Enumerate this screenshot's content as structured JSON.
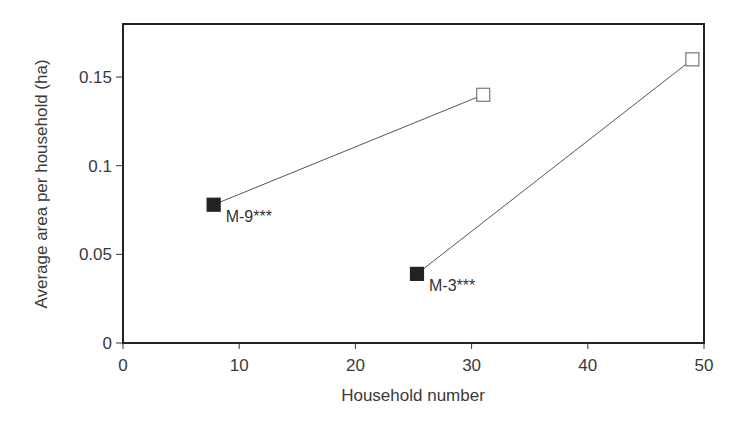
{
  "chart_data": {
    "type": "line",
    "title": "",
    "xlabel": "Household number",
    "ylabel": "Average area per household (ha)",
    "xlim": [
      0,
      50
    ],
    "ylim": [
      0,
      0.18
    ],
    "x_ticks": [
      "0",
      "10",
      "20",
      "30",
      "40",
      "50"
    ],
    "y_ticks": [
      "0",
      "0.05",
      "0.1",
      "0.15"
    ],
    "grid": false,
    "legend": null,
    "series": [
      {
        "name": "M-9***",
        "points": [
          {
            "x": 7.8,
            "y": 0.078,
            "marker": "filled-square"
          },
          {
            "x": 31,
            "y": 0.14,
            "marker": "open-square"
          }
        ],
        "label": "M-9***"
      },
      {
        "name": "M-3***",
        "points": [
          {
            "x": 25.3,
            "y": 0.039,
            "marker": "filled-square"
          },
          {
            "x": 49,
            "y": 0.16,
            "marker": "open-square"
          }
        ],
        "label": "M-3***"
      }
    ]
  }
}
